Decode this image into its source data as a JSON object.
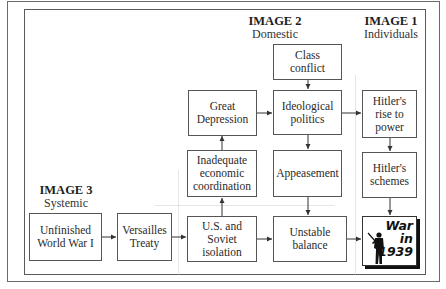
{
  "diagram": {
    "type": "causal-flow",
    "headings": {
      "image1": {
        "title": "IMAGE 1",
        "subtitle": "Individuals"
      },
      "image2": {
        "title": "IMAGE 2",
        "subtitle": "Domestic"
      },
      "image3": {
        "title": "IMAGE 3",
        "subtitle": "Systemic"
      }
    },
    "nodes": {
      "unfinished_ww1": "Unfinished\nWorld War I",
      "versailles": "Versailles\nTreaty",
      "us_soviet": "U.S. and\nSoviet\nisolation",
      "inadequate_econ": "Inadequate\neconomic\ncoordination",
      "great_depression": "Great\nDepression",
      "class_conflict": "Class\nconflict",
      "ideological_politics": "Ideological\npolitics",
      "appeasement": "Appeasement",
      "unstable_balance": "Unstable\nbalance",
      "hitler_rise": "Hitler's\nrise to\npower",
      "hitler_schemes": "Hitler's\nschemes",
      "war_1939": {
        "line1": "War",
        "line2": "in",
        "line3": "1939",
        "icon": "soldier-silhouette-icon"
      }
    },
    "edges": [
      {
        "from": "Unfinished World War I",
        "to": "Versailles Treaty"
      },
      {
        "from": "Versailles Treaty",
        "to": "U.S. and Soviet isolation"
      },
      {
        "from": "U.S. and Soviet isolation",
        "to": "Inadequate economic coordination"
      },
      {
        "from": "Inadequate economic coordination",
        "to": "Great Depression"
      },
      {
        "from": "Great Depression",
        "to": "Ideological politics"
      },
      {
        "from": "Class conflict",
        "to": "Ideological politics"
      },
      {
        "from": "Ideological politics",
        "to": "Appeasement"
      },
      {
        "from": "Ideological politics",
        "to": "Hitler's rise to power"
      },
      {
        "from": "Appeasement",
        "to": "Unstable balance"
      },
      {
        "from": "U.S. and Soviet isolation",
        "to": "Unstable balance"
      },
      {
        "from": "Unstable balance",
        "to": "War in 1939"
      },
      {
        "from": "Hitler's rise to power",
        "to": "Hitler's schemes"
      },
      {
        "from": "Hitler's schemes",
        "to": "War in 1939"
      }
    ]
  }
}
